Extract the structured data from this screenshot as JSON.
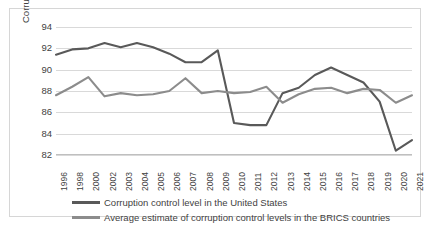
{
  "chart_data": {
    "type": "line",
    "title": "",
    "xlabel": "",
    "ylabel": "Corruption control level",
    "ylim": [
      82,
      94
    ],
    "yticks": [
      82,
      84,
      86,
      88,
      90,
      92,
      94
    ],
    "grid": true,
    "legend_position": "bottom",
    "categories": [
      "1996",
      "1998",
      "2000",
      "2002",
      "2003",
      "2004",
      "2005",
      "2006",
      "2007",
      "2008",
      "2009",
      "2010",
      "2011",
      "2012",
      "2013",
      "2014",
      "2015",
      "2016",
      "2017",
      "2018",
      "2019",
      "2020",
      "2021"
    ],
    "series": [
      {
        "name": "Corruption control level in the United States",
        "color": "#595959",
        "values": [
          91.4,
          91.9,
          92.0,
          92.5,
          92.1,
          92.5,
          92.1,
          91.5,
          90.7,
          90.7,
          91.8,
          85.0,
          84.8,
          84.8,
          87.8,
          88.3,
          89.5,
          90.2,
          89.5,
          88.8,
          87.0,
          82.4,
          83.4
        ]
      },
      {
        "name": "Average estimate of corruption control levels in the BRICS countries",
        "color": "#8c8c8c",
        "values": [
          87.6,
          88.4,
          89.3,
          87.5,
          87.8,
          87.6,
          87.7,
          88.0,
          89.2,
          87.8,
          88.0,
          87.8,
          87.9,
          88.4,
          86.9,
          87.7,
          88.2,
          88.3,
          87.8,
          88.2,
          88.1,
          86.9,
          87.6
        ]
      }
    ]
  },
  "legend": {
    "items": [
      {
        "label": "Corruption control level in the United States"
      },
      {
        "label": "Average estimate of corruption control levels in the BRICS countries"
      }
    ]
  }
}
